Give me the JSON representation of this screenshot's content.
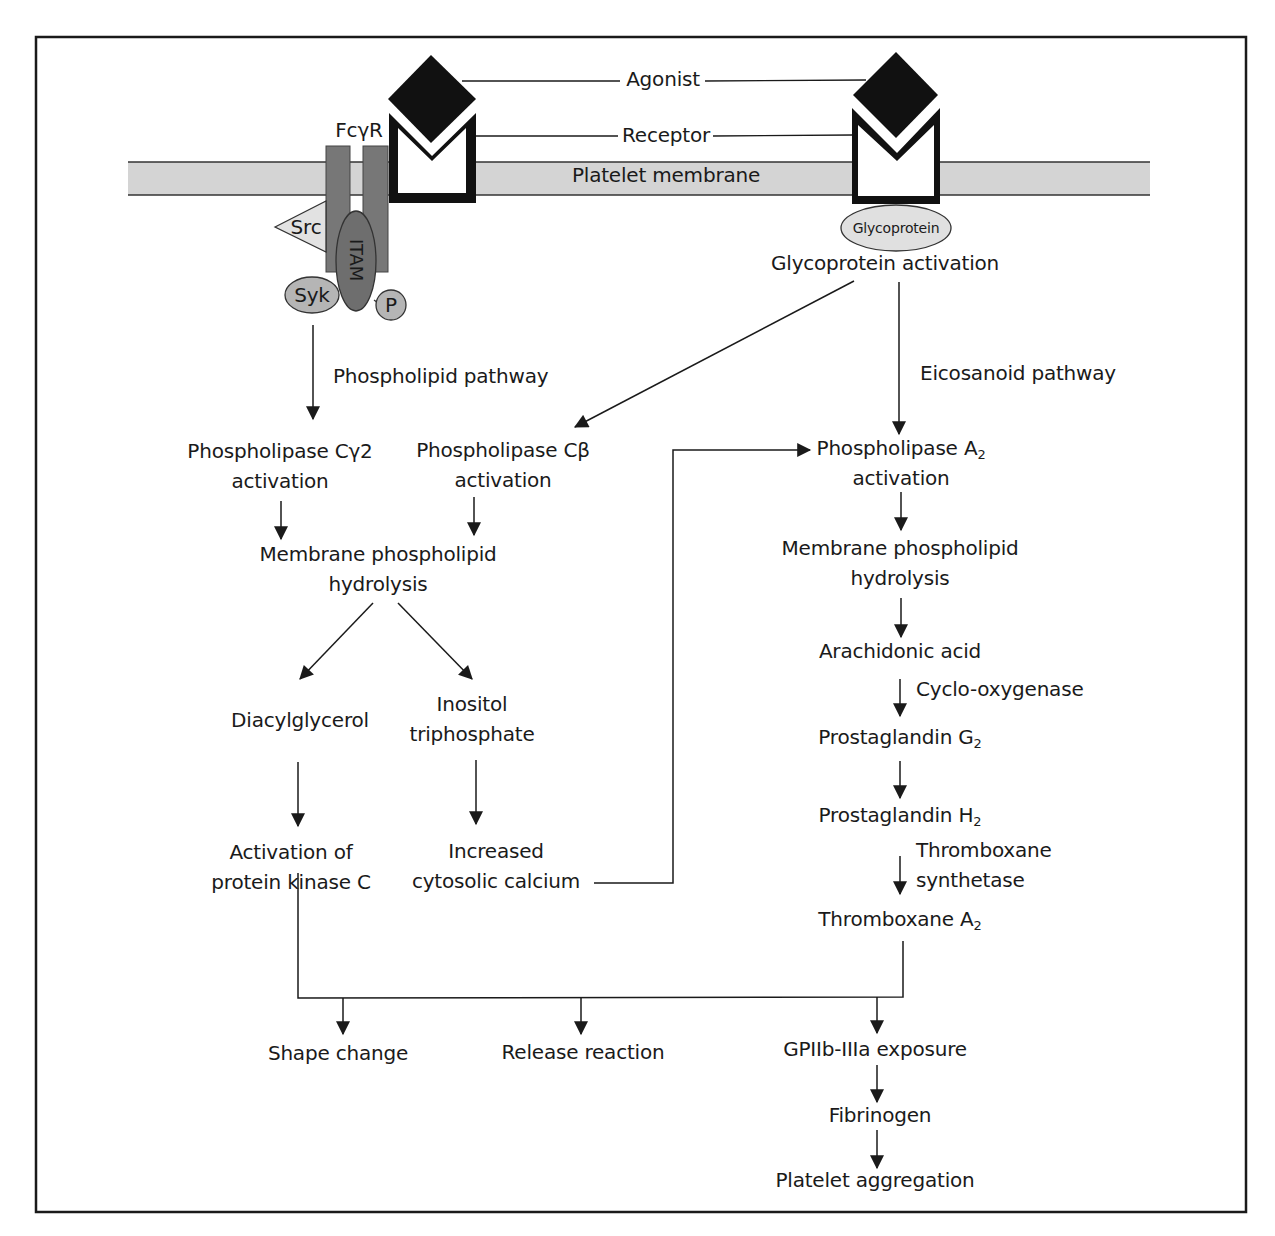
{
  "diagram": {
    "frame": {
      "border_color": "#1a1a1a"
    },
    "colors": {
      "membrane_fill": "#d4d4d4",
      "receptor_dark": "#777777",
      "itam_fill": "#6e6e6e",
      "syk_fill": "#b5b5b5",
      "src_fill": "#e2e2e2",
      "glyco_fill": "#e0e0e0",
      "agonist_fill": "#111111",
      "line": "#1a1a1a"
    },
    "top": {
      "agonist": "Agonist",
      "receptor": "Receptor",
      "membrane": "Platelet membrane",
      "fcgr": "FcγR",
      "src": "Src",
      "itam": "ITAM",
      "syk": "Syk",
      "p": "P",
      "glycoprotein_oval": "Glycoprotein",
      "glycoprotein_activation": "Glycoprotein activation"
    },
    "pathways": {
      "phospholipid": "Phospholipid pathway",
      "eicosanoid": "Eicosanoid pathway"
    },
    "left_column": {
      "plc_gamma2_line1": "Phospholipase Cγ2",
      "plc_gamma2_line2": "activation",
      "plc_beta_line1": "Phospholipase Cβ",
      "plc_beta_line2": "activation",
      "hydrolysis_line1": "Membrane phospholipid",
      "hydrolysis_line2": "hydrolysis",
      "dag": "Diacylglycerol",
      "ip3_line1": "Inositol",
      "ip3_line2": "triphosphate",
      "pkc_line1": "Activation of",
      "pkc_line2": "protein kinase C",
      "calcium_line1": "Increased",
      "calcium_line2": "cytosolic calcium"
    },
    "right_column": {
      "pla2_line1": "Phospholipase A",
      "pla2_sub": "2",
      "pla2_line2": "activation",
      "hydrolysis_line1": "Membrane phospholipid",
      "hydrolysis_line2": "hydrolysis",
      "arachidonic": "Arachidonic acid",
      "cox": "Cyclo-oxygenase",
      "pgg2": "Prostaglandin G",
      "pgg2_sub": "2",
      "pgh2": "Prostaglandin H",
      "pgh2_sub": "2",
      "txs_line1": "Thromboxane",
      "txs_line2": "synthetase",
      "txa2": "Thromboxane A",
      "txa2_sub": "2"
    },
    "outcomes": {
      "shape_change": "Shape change",
      "release_reaction": "Release reaction",
      "gpiib": "GPIIb-IIIa exposure",
      "fibrinogen": "Fibrinogen",
      "aggregation": "Platelet aggregation"
    }
  }
}
